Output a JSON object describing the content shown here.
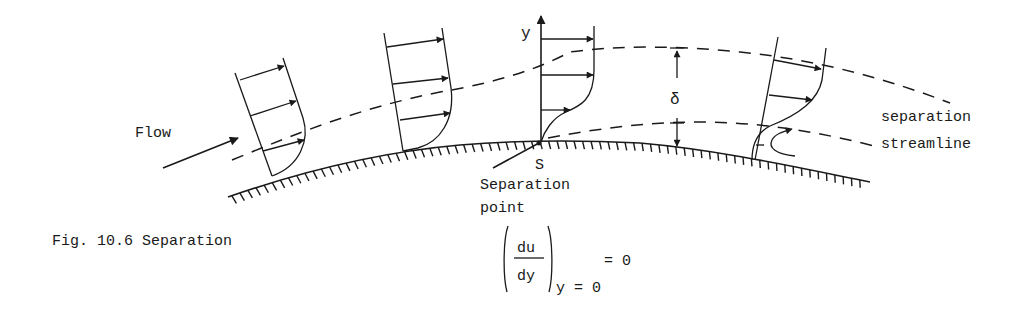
{
  "figure": {
    "caption": "Fig. 10.6 Separation",
    "flow_label": "Flow",
    "y_axis_label": "y",
    "delta_label": "δ",
    "s_label": "S",
    "separation_point_label_line1": "Separation",
    "separation_point_label_line2": "point",
    "separation_streamline_line1": "separation",
    "separation_streamline_line2": "streamline",
    "equation": {
      "numerator": "du",
      "denominator": "dy",
      "subscript": "y = 0",
      "rhs": "= 0"
    },
    "profiles": [
      {
        "name": "attached-profile-1",
        "state": "favorable pressure gradient"
      },
      {
        "name": "attached-profile-2",
        "state": "adverse pressure gradient"
      },
      {
        "name": "separation-profile",
        "state": "zero wall shear"
      },
      {
        "name": "reversed-flow-profile",
        "state": "separated, backflow"
      }
    ]
  }
}
